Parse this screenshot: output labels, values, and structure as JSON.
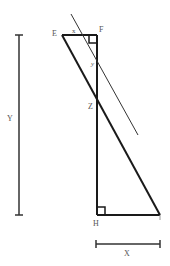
{
  "diagram": {
    "labels": {
      "E": "E",
      "F": "F",
      "x_angle": "x",
      "Y_point": "y",
      "Z": "Z",
      "H": "H",
      "dim_X": "X",
      "dim_Y": "Y"
    },
    "colors": {
      "stroke": "#1a1a1a",
      "thin": "#333333",
      "label": "#555555",
      "background": "#ffffff"
    }
  }
}
